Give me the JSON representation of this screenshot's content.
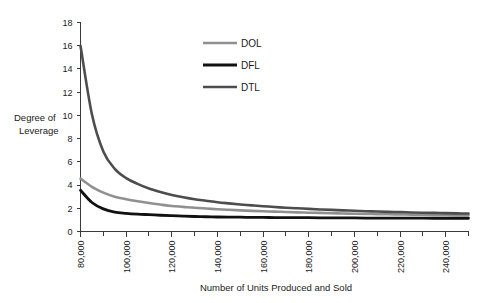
{
  "chart_data": {
    "type": "line",
    "title": "",
    "xlabel": "Number of Units Produced and Sold",
    "ylabel": "Degree of Leverage",
    "xlim": [
      80000,
      250000
    ],
    "ylim": [
      0,
      18
    ],
    "grid": false,
    "legend_position": "inside-top-center",
    "x_tick_labels": [
      "80,000",
      "100,000",
      "120,000",
      "140,000",
      "160,000",
      "180,000",
      "200,000",
      "220,000",
      "240,000"
    ],
    "x_tick_values": [
      80000,
      100000,
      120000,
      140000,
      160000,
      180000,
      200000,
      220000,
      240000
    ],
    "x_minor_tick_values": [
      90000,
      110000,
      130000,
      150000,
      170000,
      190000,
      210000,
      230000,
      250000
    ],
    "y_tick_labels": [
      "0",
      "2",
      "4",
      "6",
      "8",
      "10",
      "12",
      "14",
      "16",
      "18"
    ],
    "y_tick_values": [
      0,
      2,
      4,
      6,
      8,
      10,
      12,
      14,
      16,
      18
    ],
    "x": [
      80000,
      85000,
      90000,
      95000,
      100000,
      105000,
      110000,
      115000,
      120000,
      125000,
      130000,
      135000,
      140000,
      145000,
      150000,
      155000,
      160000,
      165000,
      170000,
      175000,
      180000,
      185000,
      190000,
      195000,
      200000,
      205000,
      210000,
      215000,
      220000,
      225000,
      230000,
      235000,
      240000,
      245000,
      250000
    ],
    "series": [
      {
        "name": "DOL",
        "color": "#909090",
        "width": 2.6,
        "values": [
          4.55,
          3.85,
          3.35,
          3.0,
          2.78,
          2.6,
          2.45,
          2.32,
          2.2,
          2.12,
          2.04,
          1.98,
          1.92,
          1.87,
          1.82,
          1.78,
          1.74,
          1.71,
          1.68,
          1.65,
          1.62,
          1.6,
          1.57,
          1.55,
          1.53,
          1.51,
          1.5,
          1.48,
          1.47,
          1.45,
          1.44,
          1.43,
          1.42,
          1.41,
          1.4
        ]
      },
      {
        "name": "DFL",
        "color": "#111111",
        "width": 2.8,
        "values": [
          3.55,
          2.5,
          1.95,
          1.67,
          1.57,
          1.5,
          1.45,
          1.4,
          1.36,
          1.32,
          1.29,
          1.27,
          1.25,
          1.24,
          1.23,
          1.22,
          1.21,
          1.2,
          1.2,
          1.19,
          1.19,
          1.18,
          1.18,
          1.17,
          1.17,
          1.16,
          1.16,
          1.16,
          1.15,
          1.15,
          1.15,
          1.14,
          1.14,
          1.14,
          1.14
        ]
      },
      {
        "name": "DTL",
        "color": "#4d4d4d",
        "width": 2.6,
        "values": [
          16.0,
          10.1,
          6.9,
          5.4,
          4.6,
          4.1,
          3.7,
          3.4,
          3.15,
          2.95,
          2.78,
          2.65,
          2.52,
          2.42,
          2.33,
          2.25,
          2.18,
          2.11,
          2.05,
          2.0,
          1.95,
          1.9,
          1.86,
          1.82,
          1.79,
          1.75,
          1.72,
          1.69,
          1.67,
          1.64,
          1.62,
          1.6,
          1.58,
          1.56,
          1.55
        ]
      }
    ]
  },
  "legend": {
    "items": [
      {
        "label": "DOL"
      },
      {
        "label": "DFL"
      },
      {
        "label": "DTL"
      }
    ]
  },
  "axes": {
    "y_title_line1": "Degree of",
    "y_title_line2": "Leverage",
    "x_title": "Number of Units Produced and Sold"
  }
}
